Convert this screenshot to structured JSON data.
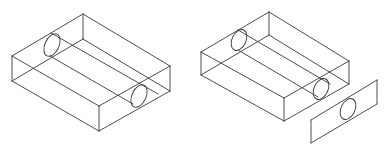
{
  "figure": {
    "panels": [
      {
        "id": "left",
        "label": "",
        "box": {
          "top": [
            83,
            14
          ],
          "left": [
            12,
            56
          ],
          "front": [
            99,
            106
          ],
          "right": [
            170,
            66
          ],
          "height": 25
        },
        "hole_lines": [
          [
            [
              51,
              33
            ],
            [
              158,
              94
            ]
          ],
          [
            [
              50,
              56
            ],
            [
              133,
              104
            ]
          ]
        ],
        "holes": [
          {
            "cx": 52,
            "cy": 45,
            "rx": 7,
            "ry": 12,
            "rot": 25
          },
          {
            "cx": 139,
            "cy": 96,
            "rx": 7,
            "ry": 12,
            "rot": 25
          }
        ]
      },
      {
        "id": "right",
        "label": "",
        "box": {
          "top": [
            269,
            12
          ],
          "left": [
            201,
            52
          ],
          "front": [
            284,
            98
          ],
          "right": [
            349,
            61
          ],
          "height": 23
        },
        "hole_lines": [
          [
            [
              238,
              30
            ],
            [
              330,
              84
            ]
          ],
          [
            [
              238,
              50
            ],
            [
              318,
              97
            ]
          ]
        ],
        "holes": [
          {
            "cx": 239,
            "cy": 40,
            "rx": 7,
            "ry": 11,
            "rot": 25
          },
          {
            "cx": 321,
            "cy": 89,
            "rx": 7,
            "ry": 11,
            "rot": 25
          }
        ],
        "plate": {
          "corners": [
            [
              311,
              120
            ],
            [
              377,
              80
            ],
            [
              377,
              104
            ],
            [
              311,
              143
            ]
          ],
          "hole": {
            "cx": 348,
            "cy": 109,
            "rx": 7,
            "ry": 11,
            "rot": 25
          }
        }
      }
    ]
  }
}
